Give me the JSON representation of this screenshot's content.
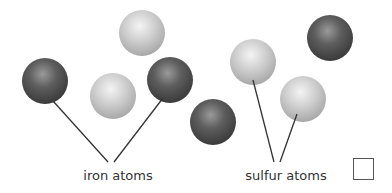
{
  "diagram": {
    "labels": {
      "iron": "iron atoms",
      "sulfur": "sulfur atoms"
    },
    "colors": {
      "iron_light": "#9a9a9a",
      "iron_mid": "#5e5e5e",
      "iron_dark": "#3a3a3a",
      "sulfur_light": "#f4f4f4",
      "sulfur_mid": "#cfcfcf",
      "sulfur_dark": "#a8a8a8",
      "line": "#333333"
    },
    "atoms": [
      {
        "type": "iron",
        "cx": 45,
        "cy": 81,
        "r": 23
      },
      {
        "type": "iron",
        "cx": 170,
        "cy": 80,
        "r": 23
      },
      {
        "type": "iron",
        "cx": 213,
        "cy": 122,
        "r": 23
      },
      {
        "type": "iron",
        "cx": 330,
        "cy": 38,
        "r": 23
      },
      {
        "type": "sulfur",
        "cx": 142,
        "cy": 33,
        "r": 23
      },
      {
        "type": "sulfur",
        "cx": 113,
        "cy": 96,
        "r": 23
      },
      {
        "type": "sulfur",
        "cx": 253,
        "cy": 62,
        "r": 23
      },
      {
        "type": "sulfur",
        "cx": 303,
        "cy": 99,
        "r": 23
      }
    ]
  },
  "answer_checkbox": {
    "checked": false
  }
}
